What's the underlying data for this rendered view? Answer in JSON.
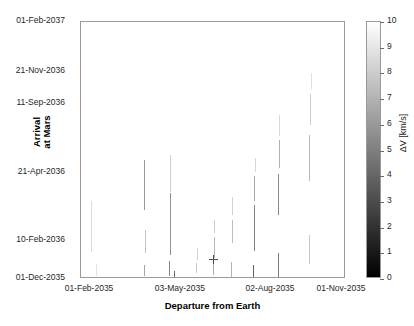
{
  "chart_data": {
    "type": "scatter",
    "title": "",
    "xlabel": "Departure from Earth",
    "ylabel_line1": "Arrival",
    "ylabel_line2": "at Mars",
    "xtick_labels": [
      "01-Feb-2035",
      "03-May-2035",
      "02-Aug-2035",
      "01-Nov-2035"
    ],
    "xtick_frac": [
      0.034,
      0.377,
      0.717,
      0.985
    ],
    "ytick_labels": [
      "01-Dec-2035",
      "10-Feb-2036",
      "21-Apr-2036",
      "11-Sep-2036",
      "21-Nov-2036",
      "01-Feb-2037"
    ],
    "ytick_frac": [
      0.0,
      0.148,
      0.411,
      0.681,
      0.805,
      1.0
    ],
    "xlim": [
      "22-Jan-2035",
      "06-Nov-2035"
    ],
    "ylim": [
      "01-Dec-2035",
      "01-Feb-2037"
    ],
    "grid": false,
    "colorbar": {
      "label": "ΔV [km/s]",
      "min": 0,
      "max": 10,
      "ticks": [
        0,
        1,
        2,
        3,
        4,
        5,
        6,
        7,
        8,
        9,
        10
      ],
      "colormap": "gray",
      "low_color": "#000000",
      "high_color": "#ffffff"
    },
    "marker": {
      "name": "optimum-cross",
      "symbol": "+",
      "x_frac": 0.498,
      "y_frac": 0.078,
      "color": "#4a4a4a"
    },
    "series_note": "Vertical line segments of feasible transfer solutions shaded by delta-V",
    "segments": [
      {
        "x_frac": 0.038,
        "y0_frac": 0.105,
        "y1_frac": 0.302,
        "dv": 8.6
      },
      {
        "x_frac": 0.055,
        "y0_frac": 0.012,
        "y1_frac": 0.06,
        "dv": 8.9
      },
      {
        "x_frac": 0.236,
        "y0_frac": 0.012,
        "y1_frac": 0.055,
        "dv": 6.4
      },
      {
        "x_frac": 0.238,
        "y0_frac": 0.27,
        "y1_frac": 0.462,
        "dv": 6.0
      },
      {
        "x_frac": 0.24,
        "y0_frac": 0.1,
        "y1_frac": 0.19,
        "dv": 7.6
      },
      {
        "x_frac": 0.33,
        "y0_frac": 0.012,
        "y1_frac": 0.07,
        "dv": 5.2
      },
      {
        "x_frac": 0.334,
        "y0_frac": 0.095,
        "y1_frac": 0.335,
        "dv": 5.7
      },
      {
        "x_frac": 0.336,
        "y0_frac": 0.34,
        "y1_frac": 0.482,
        "dv": 8.1
      },
      {
        "x_frac": 0.352,
        "y0_frac": 0.0,
        "y1_frac": 0.03,
        "dv": 4.1
      },
      {
        "x_frac": 0.435,
        "y0_frac": 0.022,
        "y1_frac": 0.062,
        "dv": 7.8
      },
      {
        "x_frac": 0.437,
        "y0_frac": 0.075,
        "y1_frac": 0.12,
        "dv": 8.3
      },
      {
        "x_frac": 0.498,
        "y0_frac": 0.015,
        "y1_frac": 0.072,
        "dv": 6.7
      },
      {
        "x_frac": 0.5,
        "y0_frac": 0.082,
        "y1_frac": 0.165,
        "dv": 7.2
      },
      {
        "x_frac": 0.502,
        "y0_frac": 0.178,
        "y1_frac": 0.23,
        "dv": 8.0
      },
      {
        "x_frac": 0.566,
        "y0_frac": 0.008,
        "y1_frac": 0.068,
        "dv": 7.0
      },
      {
        "x_frac": 0.568,
        "y0_frac": 0.14,
        "y1_frac": 0.228,
        "dv": 7.4
      },
      {
        "x_frac": 0.57,
        "y0_frac": 0.25,
        "y1_frac": 0.32,
        "dv": 8.2
      },
      {
        "x_frac": 0.65,
        "y0_frac": 0.0,
        "y1_frac": 0.055,
        "dv": 3.8
      },
      {
        "x_frac": 0.652,
        "y0_frac": 0.108,
        "y1_frac": 0.29,
        "dv": 5.1
      },
      {
        "x_frac": 0.654,
        "y0_frac": 0.302,
        "y1_frac": 0.4,
        "dv": 6.6
      },
      {
        "x_frac": 0.656,
        "y0_frac": 0.415,
        "y1_frac": 0.47,
        "dv": 8.4
      },
      {
        "x_frac": 0.742,
        "y0_frac": 0.0,
        "y1_frac": 0.1,
        "dv": 4.6
      },
      {
        "x_frac": 0.744,
        "y0_frac": 0.25,
        "y1_frac": 0.41,
        "dv": 5.3
      },
      {
        "x_frac": 0.746,
        "y0_frac": 0.43,
        "y1_frac": 0.54,
        "dv": 6.9
      },
      {
        "x_frac": 0.748,
        "y0_frac": 0.555,
        "y1_frac": 0.64,
        "dv": 8.5
      },
      {
        "x_frac": 0.86,
        "y0_frac": 0.06,
        "y1_frac": 0.17,
        "dv": 7.9
      },
      {
        "x_frac": 0.862,
        "y0_frac": 0.38,
        "y1_frac": 0.56,
        "dv": 7.3
      },
      {
        "x_frac": 0.864,
        "y0_frac": 0.6,
        "y1_frac": 0.72,
        "dv": 8.0
      },
      {
        "x_frac": 0.866,
        "y0_frac": 0.74,
        "y1_frac": 0.8,
        "dv": 8.8
      }
    ]
  }
}
